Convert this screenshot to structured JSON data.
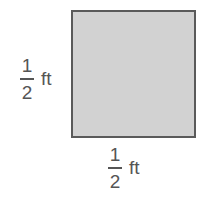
{
  "figure": {
    "shape": "square",
    "fill_color": "#d2d2d2",
    "border_color": "#5a5a5a",
    "side_label_left": {
      "numerator": "1",
      "denominator": "2",
      "unit": "ft"
    },
    "side_label_bottom": {
      "numerator": "1",
      "denominator": "2",
      "unit": "ft"
    }
  }
}
